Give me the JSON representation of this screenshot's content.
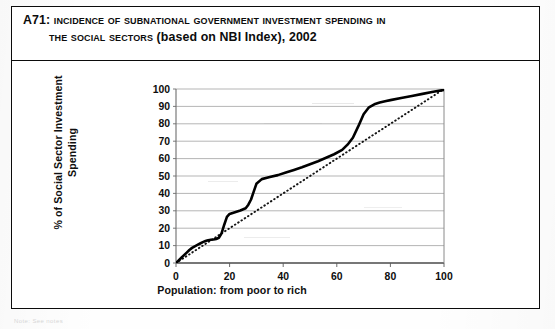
{
  "document": {
    "table_code": "A71",
    "title_line1": "Incidence of Subnational Government Investment Spending in",
    "title_line2_sc": "the Social Sectors",
    "title_line2_rest": "(based on NBI Index), 2002",
    "title_full": "A71: Incidence of Subnational Government Investment Spending in the Social Sectors (based on NBI Index), 2002",
    "footnote": "Note: See notes"
  },
  "colors": {
    "frame": "#0b0b0b",
    "text": "#0c0c0c",
    "gridline": "#a8a8a8",
    "axis": "#6f6f6f",
    "curve": "#000000",
    "equality_line": "#111111",
    "plot_background": "#ffffff"
  },
  "chart_data": {
    "type": "line",
    "title": "",
    "xlabel": "Population: from poor to rich",
    "ylabel": "% of Social Sector Investment Spending",
    "xlim": [
      0,
      100
    ],
    "ylim": [
      0,
      100
    ],
    "xticks": [
      0,
      20,
      40,
      60,
      80,
      100
    ],
    "yticks": [
      0,
      10,
      20,
      30,
      40,
      50,
      60,
      70,
      80,
      90,
      100
    ],
    "xtick_labels": [
      "0",
      "20",
      "40",
      "60",
      "80",
      "100"
    ],
    "ytick_labels": [
      "0",
      "10",
      "20",
      "30",
      "40",
      "50",
      "60",
      "70",
      "80",
      "90",
      "100"
    ],
    "grid": "horizontal",
    "legend": "none",
    "series": [
      {
        "name": "Concentration curve (investment spending)",
        "style": "solid-thick",
        "x": [
          0,
          1,
          2,
          3,
          4,
          5,
          6,
          7,
          8,
          9,
          10,
          11,
          12,
          13,
          14,
          15,
          16,
          17,
          18,
          19,
          20,
          22,
          24,
          26,
          27,
          28,
          29,
          30,
          32,
          35,
          38,
          41,
          44,
          47,
          50,
          53,
          56,
          59,
          62,
          64,
          66,
          68,
          70,
          72,
          74,
          76,
          78,
          80,
          84,
          88,
          92,
          96,
          100
        ],
        "y": [
          0,
          1.5,
          3,
          4.5,
          6,
          7.5,
          8.7,
          9.6,
          10.4,
          11.2,
          12,
          12.6,
          13.1,
          13.4,
          13.5,
          13.8,
          14.5,
          17,
          22,
          26.5,
          28.2,
          29.2,
          30.2,
          31.5,
          33.5,
          36.5,
          41,
          45.5,
          48.2,
          49.4,
          50.5,
          52,
          53.5,
          55,
          56.8,
          58.5,
          60.5,
          62.5,
          65,
          68,
          72,
          78.5,
          85.5,
          89.5,
          91.2,
          92.2,
          93,
          93.6,
          94.8,
          96,
          97.2,
          98.4,
          99.5
        ]
      },
      {
        "name": "Line of equality (45 degrees)",
        "style": "dotted",
        "x": [
          0,
          100
        ],
        "y": [
          0,
          100
        ]
      }
    ]
  },
  "axes": {
    "y_axis_name": "y-axis",
    "x_axis_name": "x-axis"
  }
}
